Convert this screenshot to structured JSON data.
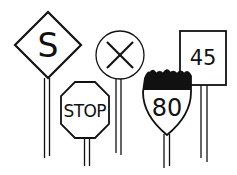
{
  "illustration": {
    "description": "Line drawing of five road signs on posts",
    "stroke_color": "#111111",
    "background": "#ffffff",
    "signs": [
      {
        "name": "diamond-sign",
        "shape": "diamond",
        "label": "S"
      },
      {
        "name": "circle-sign",
        "shape": "circle",
        "label": "X"
      },
      {
        "name": "stop-sign",
        "shape": "octagon",
        "label": "STOP"
      },
      {
        "name": "interstate-shield-sign",
        "shape": "shield",
        "label": "80"
      },
      {
        "name": "speed-limit-sign",
        "shape": "rectangle",
        "label": "45"
      }
    ]
  }
}
